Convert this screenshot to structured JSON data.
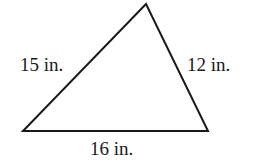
{
  "diagram": {
    "type": "triangle",
    "stroke_color": "#1a1a1a",
    "background": "#ffffff",
    "vertices": {
      "top": [
        146,
        4
      ],
      "bottom_left": [
        23,
        131
      ],
      "bottom_right": [
        208,
        131
      ]
    },
    "sides": [
      {
        "id": "left",
        "label": "15 in.",
        "length": 15,
        "unit": "in."
      },
      {
        "id": "right",
        "label": "12 in.",
        "length": 12,
        "unit": "in."
      },
      {
        "id": "bottom",
        "label": "16 in.",
        "length": 16,
        "unit": "in."
      }
    ]
  }
}
